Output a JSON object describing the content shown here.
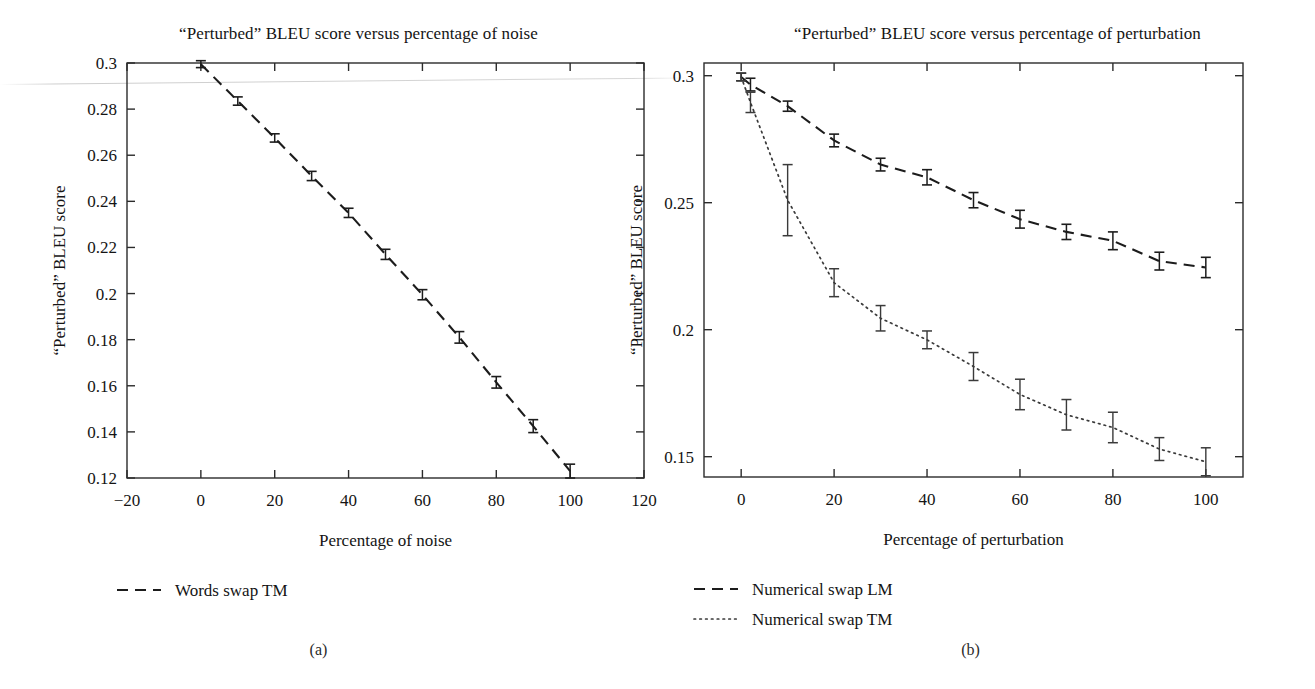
{
  "figure": {
    "panels": [
      {
        "caption": "(a)",
        "title": "“Perturbed” BLEU score versus percentage of noise",
        "xlabel": "Percentage of noise",
        "ylabel": "“Perturbed” BLEU score"
      },
      {
        "caption": "(b)",
        "title": "“Perturbed” BLEU score versus percentage of perturbation",
        "xlabel": "Percentage of perturbation",
        "ylabel": "“Perturbed” BLEU score"
      }
    ]
  },
  "chart_data": [
    {
      "type": "line",
      "title": "“Perturbed” BLEU score versus percentage of noise",
      "xlabel": "Percentage of noise",
      "ylabel": "“Perturbed” BLEU score",
      "xlim": [
        -20,
        120
      ],
      "ylim": [
        0.12,
        0.3
      ],
      "xticks": [
        -20,
        0,
        20,
        40,
        60,
        80,
        100,
        120
      ],
      "xticklabels": [
        "−20",
        "0",
        "20",
        "40",
        "60",
        "80",
        "100",
        "120"
      ],
      "yticks": [
        0.12,
        0.14,
        0.16,
        0.18,
        0.2,
        0.22,
        0.24,
        0.26,
        0.28,
        0.3
      ],
      "yticklabels": [
        "0.12",
        "0.14",
        "0.16",
        "0.18",
        "0.2",
        "0.22",
        "0.24",
        "0.26",
        "0.28",
        "0.3"
      ],
      "grid": false,
      "legend_position": "below-left",
      "series": [
        {
          "name": "Words swap TM",
          "style": "dashed",
          "x": [
            0,
            10,
            20,
            30,
            40,
            50,
            60,
            70,
            80,
            90,
            100
          ],
          "values": [
            0.2995,
            0.2835,
            0.2675,
            0.251,
            0.235,
            0.217,
            0.1995,
            0.181,
            0.1615,
            0.1425,
            0.123
          ],
          "errors": [
            0.0015,
            0.0018,
            0.0018,
            0.002,
            0.002,
            0.0022,
            0.0022,
            0.0025,
            0.0025,
            0.0028,
            0.003
          ]
        }
      ]
    },
    {
      "type": "line",
      "title": "“Perturbed” BLEU score versus percentage of perturbation",
      "xlabel": "Percentage of perturbation",
      "ylabel": "“Perturbed” BLEU score",
      "xlim": [
        -8,
        108
      ],
      "ylim": [
        0.142,
        0.305
      ],
      "xticks": [
        0,
        20,
        40,
        60,
        80,
        100
      ],
      "xticklabels": [
        "0",
        "20",
        "40",
        "60",
        "80",
        "100"
      ],
      "yticks": [
        0.15,
        0.2,
        0.25,
        0.3
      ],
      "yticklabels": [
        "0.15",
        "0.2",
        "0.25",
        "0.3"
      ],
      "grid": false,
      "legend_position": "below-left",
      "series": [
        {
          "name": "Numerical swap LM",
          "style": "dashed",
          "x": [
            0,
            2,
            10,
            20,
            30,
            40,
            50,
            60,
            70,
            80,
            90,
            100
          ],
          "values": [
            0.2995,
            0.2965,
            0.288,
            0.2745,
            0.265,
            0.26,
            0.251,
            0.2435,
            0.2385,
            0.235,
            0.227,
            0.2245
          ],
          "errors": [
            0.0015,
            0.0025,
            0.002,
            0.0025,
            0.0025,
            0.003,
            0.003,
            0.0035,
            0.003,
            0.0035,
            0.0035,
            0.004
          ]
        },
        {
          "name": "Numerical swap TM",
          "style": "dotted",
          "x": [
            0,
            2,
            10,
            20,
            30,
            40,
            50,
            60,
            70,
            80,
            90,
            100
          ],
          "values": [
            0.2995,
            0.2895,
            0.251,
            0.2185,
            0.2045,
            0.196,
            0.1855,
            0.1745,
            0.1665,
            0.1615,
            0.153,
            0.148
          ],
          "errors": [
            0.0015,
            0.004,
            0.014,
            0.0055,
            0.005,
            0.0035,
            0.0055,
            0.006,
            0.006,
            0.006,
            0.0045,
            0.0055
          ]
        }
      ]
    }
  ]
}
